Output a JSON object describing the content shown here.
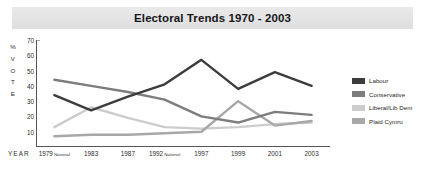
{
  "chart_data": {
    "type": "line",
    "title": "Electoral Trends 1970 - 2003",
    "xlabel": "YEAR",
    "ylabel": "% VOTE",
    "ylim": [
      0,
      70
    ],
    "yticks": [
      10,
      20,
      30,
      40,
      50,
      60,
      70
    ],
    "grid": false,
    "legend_position": "right",
    "categories": [
      "1979",
      "1983",
      "1987",
      "1992",
      "1997",
      "1999",
      "2001",
      "2003"
    ],
    "category_notes": [
      "National",
      "",
      "",
      "National",
      "",
      "",
      "",
      ""
    ],
    "series": [
      {
        "name": "Labour",
        "color": "#3c3c3c",
        "values": [
          34,
          24,
          33,
          41,
          57,
          38,
          49,
          40
        ]
      },
      {
        "name": "Conservative",
        "color": "#7d7d7d",
        "values": [
          44,
          40,
          36,
          31,
          20,
          16,
          23,
          21
        ]
      },
      {
        "name": "Liberal/Lib Dem",
        "color": "#cccccc",
        "values": [
          13,
          26,
          19,
          13,
          12,
          13,
          15,
          16
        ]
      },
      {
        "name": "Plaid Cymru",
        "color": "#a8a8a8",
        "values": [
          7,
          8,
          8,
          9,
          10,
          30,
          14,
          17
        ]
      }
    ]
  },
  "legend": {
    "items": [
      {
        "label": "Labour",
        "color": "#3c3c3c"
      },
      {
        "label": "Conservative",
        "color": "#7d7d7d"
      },
      {
        "label": "Liberal/Lib Dem",
        "color": "#cccccc"
      },
      {
        "label": "Plaid Cymru",
        "color": "#a8a8a8"
      }
    ]
  },
  "axis_title_chars": [
    "%",
    "V",
    "O",
    "T",
    "E"
  ]
}
